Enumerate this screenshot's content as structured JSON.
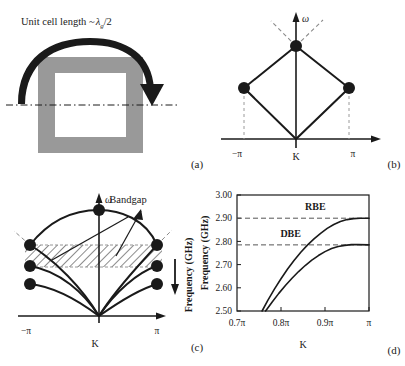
{
  "figure": {
    "background": "#ffffff",
    "ink": "#1a1a1a"
  },
  "panel_a": {
    "caption": "(a)",
    "annotation": "Unit cell length ~",
    "annotation_symbol": "λ",
    "annotation_subscript": "g",
    "annotation_tail": "/2",
    "unit_cell_color": "#999999",
    "arrow_name": "curved-propagation-arrow",
    "symmetry_line_style": "dash-dot"
  },
  "panel_b": {
    "caption": "(b)",
    "y_axis_label": "ω",
    "x_axis_label": "K",
    "x_ticks": [
      "−π",
      "π"
    ],
    "node_count": 4,
    "description": "regular-band-edge-diamond-dispersion"
  },
  "panel_c": {
    "caption": "(c)",
    "y_axis_label": "ω",
    "x_axis_label": "K",
    "x_ticks": [
      "−π",
      "π"
    ],
    "bandgap_label": "Bandgap",
    "side_y_axis_label": "Frequency (GHz)",
    "node_count": 7,
    "description": "coupled-band-dispersion-with-hatched-bandgap"
  },
  "panel_d": {
    "caption": "(d)",
    "y_axis_label": "Frequency (GHz)",
    "x_axis_label": "K",
    "markers": [
      {
        "name": "RBE",
        "value": 2.9
      },
      {
        "name": "DBE",
        "value": 2.785
      }
    ]
  },
  "chart_data": {
    "type": "line",
    "title": "",
    "xlabel": "K",
    "ylabel": "Frequency (GHz)",
    "xlim": [
      0.7,
      1.0
    ],
    "ylim": [
      2.5,
      3.0
    ],
    "xticks": [
      0.7,
      0.8,
      0.9,
      1.0
    ],
    "xticklabels": [
      "0.7π",
      "0.8π",
      "0.9π",
      "π"
    ],
    "yticks": [
      2.5,
      2.6,
      2.7,
      2.8,
      2.9,
      3.0
    ],
    "yticklabels": [
      "2.50",
      "2.60",
      "2.70",
      "2.80",
      "2.90",
      "3.00"
    ],
    "grid": false,
    "legend": false,
    "annotations": [
      {
        "text": "RBE",
        "x": 0.878,
        "y": 2.935
      },
      {
        "text": "DBE",
        "x": 0.822,
        "y": 2.818
      }
    ],
    "hlines": [
      {
        "label": "RBE",
        "y": 2.9,
        "style": "dashed"
      },
      {
        "label": "DBE",
        "y": 2.785,
        "style": "dashed"
      }
    ],
    "series": [
      {
        "name": "upper-branch-RBE",
        "x": [
          0.757,
          0.77,
          0.785,
          0.8,
          0.815,
          0.83,
          0.845,
          0.86,
          0.875,
          0.89,
          0.905,
          0.92,
          0.935,
          0.95,
          0.965,
          0.98,
          1.0
        ],
        "y": [
          2.5,
          2.546,
          2.594,
          2.639,
          2.681,
          2.719,
          2.753,
          2.784,
          2.811,
          2.835,
          2.856,
          2.873,
          2.886,
          2.894,
          2.898,
          2.9,
          2.9
        ]
      },
      {
        "name": "lower-branch-DBE",
        "x": [
          0.765,
          0.78,
          0.795,
          0.81,
          0.825,
          0.84,
          0.855,
          0.87,
          0.885,
          0.9,
          0.915,
          0.93,
          0.945,
          0.96,
          0.975,
          1.0
        ],
        "y": [
          2.5,
          2.539,
          2.576,
          2.61,
          2.641,
          2.67,
          2.696,
          2.719,
          2.739,
          2.756,
          2.769,
          2.778,
          2.783,
          2.786,
          2.786,
          2.785
        ]
      }
    ]
  }
}
